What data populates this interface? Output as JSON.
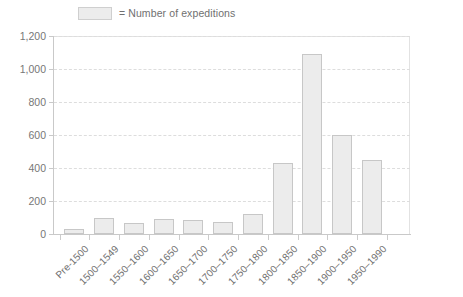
{
  "legend": {
    "swatch_name": "legend-swatch",
    "label": "= Number of expeditions"
  },
  "colors": {
    "bar_fill": "#ececec",
    "bar_border": "#c7c7c7",
    "gridline": "#dddddd",
    "axis": "#c9c9c9",
    "text": "#6f6f6f"
  },
  "chart_data": {
    "type": "bar",
    "title": "",
    "subtitle": "",
    "xlabel": "",
    "ylabel": "",
    "ylim": [
      0,
      1200
    ],
    "yticks": [
      0,
      200,
      400,
      600,
      800,
      1000,
      1200
    ],
    "ytick_labels": [
      "0",
      "200",
      "400",
      "600",
      "800",
      "1,000",
      "1,200"
    ],
    "grid": true,
    "legend_position": "top-left",
    "legend_entries": [
      "Number of expeditions"
    ],
    "categories": [
      "Pre-1500",
      "1500–1549",
      "1550–1600",
      "1600–1650",
      "1650–1700",
      "1700–1750",
      "1750–1800",
      "1800–1850",
      "1850–1900",
      "1900–1950",
      "1950–1990"
    ],
    "series": [
      {
        "name": "Number of expeditions",
        "values": [
          30,
          100,
          65,
          90,
          85,
          75,
          120,
          430,
          1090,
          600,
          450
        ]
      }
    ]
  }
}
